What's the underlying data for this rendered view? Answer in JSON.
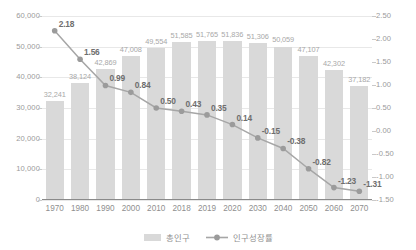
{
  "chart_data": {
    "type": "bar",
    "title": "",
    "subtitle": "",
    "xlabel": "",
    "ylabel": "",
    "grid": true,
    "legend_position": "bottom-center",
    "categories": [
      "1970",
      "1980",
      "1990",
      "2000",
      "2010",
      "2018",
      "2019",
      "2020",
      "2030",
      "2040",
      "2050",
      "2060",
      "2070"
    ],
    "series": [
      {
        "name": "총인구",
        "type": "bar",
        "axis": "left",
        "color": "#d9d9d9",
        "values": [
          32241,
          38124,
          42869,
          47008,
          49554,
          51585,
          51765,
          51836,
          51306,
          50059,
          47107,
          42302,
          37182
        ],
        "labels": [
          "32,241",
          "38,124",
          "42,869",
          "47,008",
          "49,554",
          "51,585",
          "51,765",
          "51,836",
          "51,306",
          "50,059",
          "47,107",
          "42,302",
          "37,182"
        ]
      },
      {
        "name": "인구성장률",
        "type": "line",
        "axis": "right",
        "color": "#a6a6a6",
        "values": [
          2.18,
          1.56,
          0.99,
          0.84,
          0.5,
          0.43,
          0.35,
          0.14,
          -0.15,
          -0.38,
          -0.82,
          -1.23,
          -1.31
        ],
        "labels": [
          "2.18",
          "1.56",
          "0.99",
          "0.84",
          "0.50",
          "0.43",
          "0.35",
          "0.14",
          "-0.15",
          "-0.38",
          "-0.82",
          "-1.23",
          "-1.31"
        ]
      }
    ],
    "left_axis": {
      "min": 0,
      "max": 60000,
      "step": 10000,
      "ticks": [
        "0",
        "10,000",
        "20,000",
        "30,000",
        "40,000",
        "50,000",
        "60,000"
      ]
    },
    "right_axis": {
      "min": -1.5,
      "max": 2.5,
      "step": 0.5,
      "ticks": [
        "-1.50",
        "-1.00",
        "-0.50",
        "0.00",
        "0.50",
        "1.00",
        "1.50",
        "2.00",
        "2.50"
      ]
    }
  },
  "legend": {
    "items": [
      {
        "label": "총인구",
        "marker": "bar-swatch"
      },
      {
        "label": "인구성장률",
        "marker": "line-marker-swatch"
      }
    ]
  }
}
